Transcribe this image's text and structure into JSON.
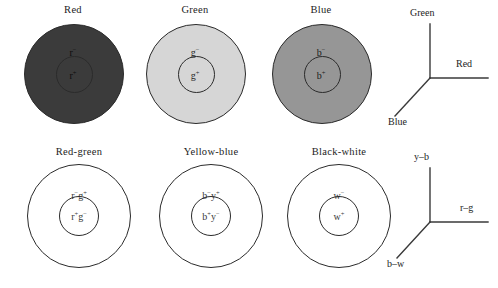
{
  "figure": {
    "background": "#ffffff",
    "stroke": "#2b2b2b"
  },
  "rows": {
    "top": {
      "cells": [
        {
          "title": "Red",
          "fill": "#3b3b3b",
          "outer_label": "r",
          "outer_sign": "−",
          "inner_label": "r",
          "inner_sign": "+"
        },
        {
          "title": "Green",
          "fill": "#d6d6d6",
          "outer_label": "g",
          "outer_sign": "−",
          "inner_label": "g",
          "inner_sign": "+"
        },
        {
          "title": "Blue",
          "fill": "#969696",
          "outer_label": "b",
          "outer_sign": "−",
          "inner_label": "b",
          "inner_sign": "+"
        }
      ],
      "axes": {
        "name": "rgb-axes",
        "vertical_label": "Green",
        "horizontal_label": "Red",
        "diagonal_label": "Blue"
      }
    },
    "bottom": {
      "cells": [
        {
          "title": "Red-green",
          "fill": "#ffffff",
          "outer_label_a": "r",
          "outer_sign_a": "−",
          "outer_label_b": "g",
          "outer_sign_b": "+",
          "inner_label_a": "r",
          "inner_sign_a": "+",
          "inner_label_b": "g",
          "inner_sign_b": "−"
        },
        {
          "title": "Yellow-blue",
          "fill": "#ffffff",
          "outer_label_a": "b",
          "outer_sign_a": "−",
          "outer_label_b": "y",
          "outer_sign_b": "+",
          "inner_label_a": "b",
          "inner_sign_a": "+",
          "inner_label_b": "y",
          "inner_sign_b": "−"
        },
        {
          "title": "Black-white",
          "fill": "#ffffff",
          "outer_label_a": "w",
          "outer_sign_a": "−",
          "outer_label_b": "",
          "outer_sign_b": "",
          "inner_label_a": "w",
          "inner_sign_a": "+",
          "inner_label_b": "",
          "inner_sign_b": ""
        }
      ],
      "axes": {
        "name": "opponent-axes",
        "vertical_label": "y–b",
        "horizontal_label": "r–g",
        "diagonal_label": "b–w"
      }
    }
  }
}
